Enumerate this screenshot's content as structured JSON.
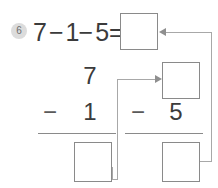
{
  "problem": {
    "number_badge": "6",
    "equation": {
      "operand1": "7",
      "operator1": "−",
      "operand2": "1",
      "operator2": "−",
      "operand3": "5",
      "equals": "=",
      "answer": ""
    }
  },
  "subproblem_left": {
    "minuend": "7",
    "operator": "−",
    "subtrahend": "1",
    "answer": ""
  },
  "subproblem_right": {
    "minuend": "",
    "operator": "−",
    "subtrahend": "5",
    "answer": ""
  },
  "boxes": {
    "top_answer": "",
    "middle_carry": "",
    "left_answer": "",
    "right_answer": ""
  },
  "colors": {
    "box_border": "#8a8a8a",
    "digit": "#3b3b3b",
    "badge_bg": "#dcdcdc",
    "badge_text": "#6e6e6e",
    "connector": "#a8a8a8",
    "page_bg": "#ffffff"
  }
}
